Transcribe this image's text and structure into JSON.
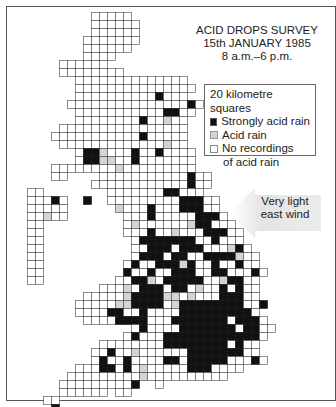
{
  "title": {
    "line1": "ACID DROPS SURVEY",
    "line2": "15th JANUARY 1985",
    "line3": "8 a.m.–6 p.m."
  },
  "legend": {
    "heading": "20 kilometre squares",
    "items": [
      {
        "key": "b",
        "label": "Strongly acid rain",
        "color": "#111111"
      },
      {
        "key": "g",
        "label": "Acid rain",
        "color": "#d4d4d4"
      },
      {
        "key": "w",
        "label": "No recordings",
        "label2": "of acid rain",
        "color": "#ffffff"
      }
    ]
  },
  "wind": {
    "line1": "Very light",
    "line2": "east wind",
    "arrow_direction": "west",
    "arrow_color": "#e6e6e6"
  },
  "grid": {
    "origin_x": 11,
    "origin_y": 12,
    "cell": 8,
    "stroke": "#444444",
    "rows": [
      "..........wwwww",
      "..........wwwwww",
      "..........wwwwww",
      ".........wwwwwww",
      ".........wwwwww",
      ".........wwww",
      "......wwwwww",
      "......wwwwwwww",
      "........wwwwwwwwwwwwww",
      "........wwwwwwwwwwwwwww",
      "........wwwwwwwwwwbwww",
      ".......wwwwwwwwwwwwwwwbw",
      "........wwwwwwwwwwwbbww",
      "........wwwwwwwwbwwgww",
      "......wwwwwwwwwwwwwwww",
      ".....wwwwwwwwwwwbwwwww",
      "......wwwwwwwwwwwwwgww",
      "........wbbgwwwbwwbwwww",
      "........wbbggwwbwwwwwww",
      ".....wwwwwwwwgwwwwwwwww",
      ".....ww....wwwwwwwwwwwbww",
      "..........wwwwwwwwwwwwbww",
      "..ww........wwwwwwwbbwww",
      "..wwwbw..b..wwwwwwwwwbbbww",
      "..wwwww......gwwwbwwwbbbww",
      "..wwgww.......wwwbwwwwwbbbw",
      "..ww..........wgwwwwwwgbbwww",
      "..ww..........wwwbwwgwwwbbbww",
      "..ww...........wbbbbbbbwwbwww",
      "..ww...........wwbbbwbbbwwwgbw",
      "..ww...........wbbbwbbwwbbbbgww",
      "..ww..........wbwwbbbgbwwbwwbww",
      "..ww..........bwwbwwbbbwwbbwwwbw",
      "..ww.........wwbbgwbbbbbwwgbbww",
      "...........wwwgwbbbwbbwgwwbwbww",
      ".........wwwwwgbbbbggwgwwwbbbww",
      "........wwwwwggbbbbwgbbbbbbbbwwb",
      "........wwwwbbwwbwwwwbbbbbbbbbw",
      ".........wwwwbbbbwwwbbbbbbbwbbbw",
      "...............wbwwwwbbbbbbbwbbww",
      "..............wbwwwbbbbbbbbbbbbw",
      "...........wwwwwwwwbbbbbbbbwbww",
      "..........wwbwwgwwwwwwbbbbbbbww",
      "..........wbwwbwwwwbbwbbbbbwwwbw",
      "........wwwbbwbwgwwwwwbbbwwww",
      ".......wwwwwwwwwgwwwwwwwwww",
      "......wwwwwwwwwb..w.....",
      "......wwwwww.ww",
      "....ww.......",
      ".....b"
    ]
  }
}
